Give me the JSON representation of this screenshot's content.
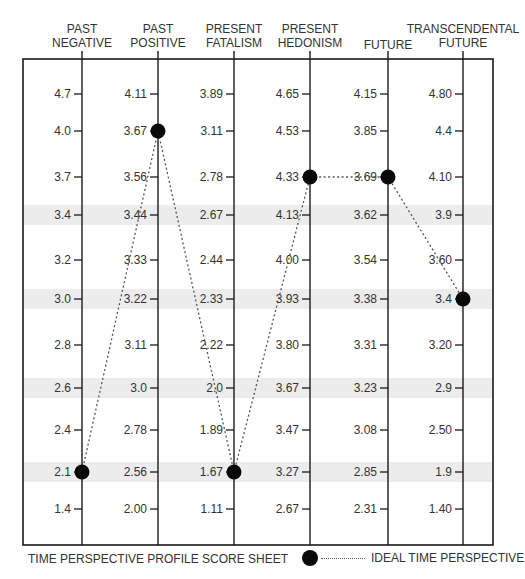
{
  "chart_data": {
    "type": "line",
    "title": "TIME PERSPECTIVE PROFILE SCORE SHEET",
    "xlabel": "",
    "ylabel": "",
    "categories": [
      "PAST NEGATIVE",
      "PAST POSITIVE",
      "PRESENT FATALISM",
      "PRESENT HEDONISM",
      "FUTURE",
      "TRANSCENDENTAL FUTURE"
    ],
    "scales": [
      {
        "name": "PAST NEGATIVE",
        "ticks": [
          "4.7",
          "4.0",
          "3.7",
          "3.4",
          "3.2",
          "3.0",
          "2.8",
          "2.6",
          "2.4",
          "2.1",
          "1.4"
        ]
      },
      {
        "name": "PAST POSITIVE",
        "ticks": [
          "4.11",
          "3.67",
          "3.56",
          "3.44",
          "3.33",
          "3.22",
          "3.11",
          "3.0",
          "2.78",
          "2.56",
          "2.00"
        ]
      },
      {
        "name": "PRESENT FATALISM",
        "ticks": [
          "3.89",
          "3.11",
          "2.78",
          "2.67",
          "2.44",
          "2.33",
          "2.22",
          "2.0",
          "1.89",
          "1.67",
          "1.11"
        ]
      },
      {
        "name": "PRESENT HEDONISM",
        "ticks": [
          "4.65",
          "4.53",
          "4.33",
          "4.13",
          "4.00",
          "3.93",
          "3.80",
          "3.67",
          "3.47",
          "3.27",
          "2.67"
        ]
      },
      {
        "name": "FUTURE",
        "ticks": [
          "4.15",
          "3.85",
          "3.69",
          "3.62",
          "3.54",
          "3.38",
          "3.31",
          "3.23",
          "3.08",
          "2.85",
          "2.31"
        ]
      },
      {
        "name": "TRANSCENDENTAL FUTURE",
        "ticks": [
          "4.80",
          "4.4",
          "4.10",
          "3.9",
          "3.60",
          "3.4",
          "3.20",
          "2.9",
          "2.50",
          "1.9",
          "1.40"
        ]
      }
    ],
    "series": [
      {
        "name": "IDEAL TIME PERSPECTIVE",
        "values": [
          2.1,
          3.67,
          1.67,
          4.33,
          3.69,
          3.4
        ],
        "row_index": [
          9,
          1,
          9,
          2,
          2,
          5
        ]
      }
    ],
    "shaded_rows": [
      3,
      5,
      7,
      9
    ],
    "legend": {
      "position": "bottom-right",
      "entries": [
        "IDEAL TIME PERSPECTIVE"
      ]
    },
    "grid": false
  },
  "headers": [
    {
      "line1": "PAST",
      "line2": "NEGATIVE"
    },
    {
      "line1": "PAST",
      "line2": "POSITIVE"
    },
    {
      "line1": "PRESENT",
      "line2": "FATALISM"
    },
    {
      "line1": "PRESENT",
      "line2": "HEDONISM"
    },
    {
      "line1": "",
      "line2": "FUTURE"
    },
    {
      "line1": "TRANSCENDENTAL",
      "line2": "FUTURE"
    }
  ],
  "footer": {
    "title": "TIME PERSPECTIVE PROFILE SCORE SHEET"
  },
  "legend": {
    "label": "IDEAL TIME PERSPECTIVE"
  },
  "colors": {
    "line": "#1a1a1a",
    "dot": "#0a0a0a",
    "shade": "#ececec",
    "text": "#333333"
  }
}
